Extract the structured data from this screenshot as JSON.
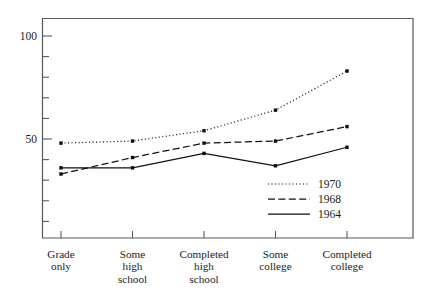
{
  "chart_data": {
    "type": "line",
    "title": "",
    "xlabel": "",
    "ylabel": "",
    "categories": [
      "Grade\nonly",
      "Some\nhigh\nschool",
      "Completed\nhigh\nschool",
      "Some\ncollege",
      "Completed\ncollege"
    ],
    "ylim": [
      0,
      110
    ],
    "ytick_labels": [
      "50",
      "100"
    ],
    "ytick_values": [
      50,
      100
    ],
    "minor_tick_values": [
      10,
      20,
      30,
      40,
      60,
      70,
      80,
      90,
      110
    ],
    "grid": false,
    "legend_position": "inside-lower-right",
    "series": [
      {
        "name": "1970",
        "style": "dotted",
        "color": "#111111",
        "values": [
          48,
          49,
          54,
          64,
          83
        ]
      },
      {
        "name": "1968",
        "style": "dashed",
        "color": "#111111",
        "values": [
          33,
          41,
          48,
          49,
          56
        ]
      },
      {
        "name": "1964",
        "style": "solid",
        "color": "#111111",
        "values": [
          36,
          36,
          43,
          37,
          46
        ]
      }
    ]
  },
  "legend": {
    "entries": [
      {
        "label": "1970"
      },
      {
        "label": "1968"
      },
      {
        "label": "1964"
      }
    ]
  },
  "axes": {
    "y_labels": [
      {
        "text": "100",
        "value": 100
      },
      {
        "text": "50",
        "value": 50
      }
    ],
    "x_labels": [
      {
        "text": "Grade\nonly"
      },
      {
        "text": "Some\nhigh\nschool"
      },
      {
        "text": "Completed\nhigh\nschool"
      },
      {
        "text": "Some\ncollege"
      },
      {
        "text": "Completed\ncollege"
      }
    ]
  }
}
